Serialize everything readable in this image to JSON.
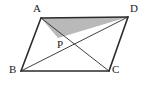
{
  "figure": {
    "background_color": "#ffffff",
    "stroke_color": "#2b2b2b",
    "shaded_region_color": "#b9b9b9",
    "shaded_region_name": "triangle-APD"
  },
  "labels": {
    "a": "A",
    "b": "B",
    "c": "C",
    "d": "D",
    "p": "P"
  },
  "points": {
    "A": {
      "x": 41,
      "y": 18
    },
    "B": {
      "x": 21,
      "y": 71
    },
    "C": {
      "x": 109,
      "y": 71
    },
    "D": {
      "x": 128,
      "y": 17
    },
    "P": {
      "x": 58,
      "y": 38
    }
  },
  "label_positions": {
    "A": {
      "x": 33,
      "y": 3
    },
    "B": {
      "x": 9,
      "y": 64
    },
    "C": {
      "x": 112,
      "y": 64
    },
    "D": {
      "x": 130,
      "y": 3
    },
    "P": {
      "x": 57,
      "y": 39
    }
  },
  "segments": [
    {
      "name": "side-AB",
      "from": "A",
      "to": "B",
      "width": 1.6
    },
    {
      "name": "side-BC",
      "from": "B",
      "to": "C",
      "width": 1.6
    },
    {
      "name": "side-CD",
      "from": "C",
      "to": "D",
      "width": 1.6
    },
    {
      "name": "side-DA",
      "from": "D",
      "to": "A",
      "width": 1.6
    },
    {
      "name": "diagonal-AC",
      "from": "A",
      "to": "C",
      "width": 0.9
    },
    {
      "name": "diagonal-BD",
      "from": "B",
      "to": "D",
      "width": 0.9
    }
  ]
}
